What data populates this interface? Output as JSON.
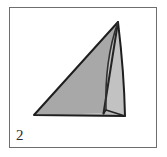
{
  "figure": {
    "panel_label": "2",
    "caption_text": "2",
    "frame": {
      "x": 9,
      "y": 7,
      "width": 148,
      "height": 141,
      "border_color": "#6e6e6e",
      "background_color": "#ffffff",
      "border_width": 1
    },
    "colors": {
      "background": "#ffffff",
      "frame_border": "#6e6e6e",
      "main_face_fill": "#a8a8a8",
      "side_face_fill": "#c2c2c2",
      "flap_face_fill": "#b0b0b0",
      "outline": "#1e1e1e",
      "crease_line": "#2a2a2a",
      "label_text": "#2b2b2b"
    },
    "shape_name": "folded-triangular-sheet",
    "vertices": {
      "apex": [
        118,
        22
      ],
      "left_corner": [
        34,
        115
      ],
      "bottom_right": [
        125,
        116
      ],
      "crease_top": [
        118,
        22
      ],
      "crease_bottom": [
        103,
        113
      ],
      "fold_inner_bottom": [
        105,
        110
      ]
    },
    "faces": [
      {
        "name": "main-triangle-face",
        "points": "34,115 118,22 103,113",
        "fill": "#a8a8a8"
      },
      {
        "name": "right-side-face",
        "points": "118,22 125,116 105,112 103,113",
        "fill": "#c2c2c2"
      },
      {
        "name": "bottom-flap-face",
        "points": "34,115 103,113 125,116",
        "fill": "#b0b0b0"
      }
    ],
    "outline_path": "M34,115 L118,22 L125,116 Z",
    "crease_path": "M118,22 L103,113"
  }
}
